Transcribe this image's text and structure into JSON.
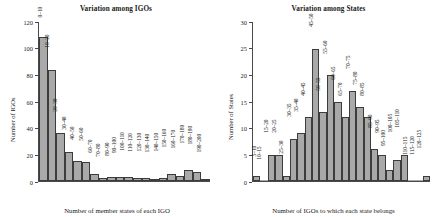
{
  "chart_data": [
    {
      "type": "bar",
      "title": "Variation among IGOs",
      "xlabel": "Number of member states of each IGO",
      "ylabel": "Number of IGOs",
      "ylim": [
        0,
        120
      ],
      "yticks": [
        0,
        20,
        40,
        60,
        80,
        100,
        120
      ],
      "grid": false,
      "legend": "none",
      "categories": [
        "0–10",
        "10–20",
        "20–30",
        "30–40",
        "40–50",
        "50–60",
        "60–70",
        "70–80",
        "80–90",
        "90–100",
        "100–110",
        "110–120",
        "120–130",
        "130–140",
        "140–150",
        "150–160",
        "160–170",
        "170–180",
        "180–190",
        "190–200"
      ],
      "values": [
        109,
        84,
        36,
        22,
        15,
        14,
        5,
        2,
        3,
        3,
        3,
        2,
        2,
        1,
        2,
        5,
        4,
        8,
        7,
        1
      ]
    },
    {
      "type": "bar",
      "title": "Variation among States",
      "xlabel": "Number of IGOs to which each state belongs",
      "ylabel": "Number of States",
      "ylim": [
        0,
        30
      ],
      "yticks": [
        0,
        5,
        10,
        15,
        20,
        25,
        30
      ],
      "grid": false,
      "legend": "none",
      "categories": [
        "5–10",
        "10–15",
        "15–20",
        "20–25",
        "25–30",
        "30–35",
        "35–40",
        "40–45",
        "45–50",
        "50–55",
        "55–60",
        "60–65",
        "65–70",
        "70–75",
        "75–80",
        "80–85",
        "85–90",
        "90–95",
        "95–100",
        "100–105",
        "105–110",
        "110–115",
        "115–120",
        "120–125"
      ],
      "values": [
        1,
        0,
        5,
        5,
        1,
        8,
        9,
        12,
        25,
        13,
        20,
        15,
        12,
        17,
        14,
        12,
        6,
        5,
        2,
        4,
        5,
        0,
        0,
        1
      ]
    }
  ],
  "style": {
    "bar_fill": "#a9a9a9",
    "bar_stroke": "#3c3c3c",
    "axis_color": "#4a4a4a",
    "background": "#ffffff"
  }
}
